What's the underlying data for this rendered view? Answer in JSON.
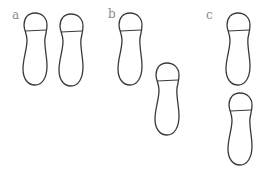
{
  "figure": {
    "panels": [
      {
        "label": "a",
        "label_pos": {
          "x": 12,
          "y": 9
        },
        "feet": [
          {
            "name": "a-left-foot",
            "x": 22,
            "y": 12,
            "w": 26,
            "h": 74
          },
          {
            "name": "a-right-foot",
            "x": 58,
            "y": 13,
            "w": 26,
            "h": 74
          }
        ]
      },
      {
        "label": "b",
        "label_pos": {
          "x": 108,
          "y": 8
        },
        "feet": [
          {
            "name": "b-first-foot",
            "x": 117,
            "y": 12,
            "w": 26,
            "h": 74
          },
          {
            "name": "b-second-foot",
            "x": 154,
            "y": 62,
            "w": 26,
            "h": 74
          }
        ]
      },
      {
        "label": "c",
        "label_pos": {
          "x": 206,
          "y": 9
        },
        "feet": [
          {
            "name": "c-first-foot",
            "x": 225,
            "y": 12,
            "w": 26,
            "h": 74
          },
          {
            "name": "c-second-foot",
            "x": 227,
            "y": 92,
            "w": 26,
            "h": 74
          }
        ]
      }
    ],
    "colors": {
      "outline": "#3a3a3a",
      "label": "#8a8a8a",
      "background": "#ffffff"
    }
  }
}
